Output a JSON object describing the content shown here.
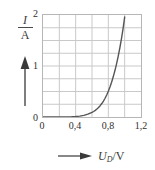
{
  "chart_data": {
    "type": "line",
    "title": "",
    "subtitle": "",
    "xlabel": "U_D / V",
    "xlabel_symbol": "U",
    "xlabel_subscript": "D",
    "xlabel_unit": "V",
    "ylabel": "I / A",
    "ylabel_symbol": "I",
    "ylabel_unit": "A",
    "xlim": [
      0,
      1.2
    ],
    "ylim": [
      0,
      2
    ],
    "xticks": [
      0,
      0.4,
      0.8,
      1.2
    ],
    "xticklabels": [
      "0",
      "0,4",
      "0,8",
      "1,2"
    ],
    "yticks": [
      0,
      1,
      2
    ],
    "yticklabels": [
      "0",
      "1",
      "2"
    ],
    "grid": true,
    "grid_x_step": 0.2,
    "grid_y_step": 0.25,
    "legend": null,
    "series": [
      {
        "name": "Diodenkennlinie",
        "color": "#555555",
        "x": [
          0.0,
          0.05,
          0.1,
          0.15,
          0.2,
          0.25,
          0.3,
          0.35,
          0.4,
          0.45,
          0.5,
          0.55,
          0.6,
          0.62,
          0.64,
          0.66,
          0.68,
          0.7,
          0.72,
          0.74,
          0.76,
          0.78,
          0.8,
          0.82,
          0.84,
          0.86,
          0.88,
          0.9,
          0.92,
          0.94,
          0.96,
          0.98,
          1.0
        ],
        "y": [
          0.0,
          0.0,
          0.0,
          0.0,
          0.001,
          0.002,
          0.003,
          0.005,
          0.01,
          0.018,
          0.032,
          0.055,
          0.09,
          0.108,
          0.13,
          0.156,
          0.186,
          0.222,
          0.264,
          0.312,
          0.368,
          0.432,
          0.505,
          0.588,
          0.682,
          0.788,
          0.906,
          1.038,
          1.185,
          1.348,
          1.528,
          1.726,
          1.96
        ]
      }
    ],
    "annotations": []
  },
  "axes": {
    "y_ticks": [
      {
        "label": "2",
        "value": 2
      },
      {
        "label": "1",
        "value": 1
      },
      {
        "label": "0",
        "value": 0
      }
    ],
    "x_ticks": [
      {
        "label": "0",
        "value": 0
      },
      {
        "label": "0,4",
        "value": 0.4
      },
      {
        "label": "0,8",
        "value": 0.8
      },
      {
        "label": "1,2",
        "value": 1.2
      }
    ]
  },
  "labels": {
    "y_numerator": "I",
    "y_denominator": "A",
    "x_symbol": "U",
    "x_subscript": "D",
    "x_unit": "V",
    "x_separator": "/"
  },
  "icons": {
    "y_axis_arrow": "arrow-up-icon",
    "x_axis_arrow": "arrow-right-icon"
  },
  "colors": {
    "curve": "#555555",
    "grid": "#c9c9c9",
    "frame": "#b6b6b6",
    "text": "#2f2f2f",
    "background": "#ffffff"
  }
}
